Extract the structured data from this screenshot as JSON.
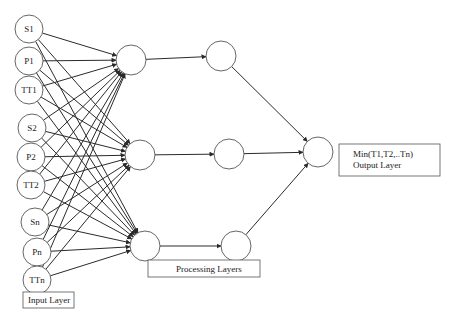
{
  "diagram": {
    "input_nodes": [
      {
        "id": "S1",
        "label": "S1",
        "cx": 29,
        "cy": 29
      },
      {
        "id": "P1",
        "label": "P1",
        "cx": 29,
        "cy": 61
      },
      {
        "id": "TT1",
        "label": "TT1",
        "cx": 29,
        "cy": 90
      },
      {
        "id": "S2",
        "label": "S2",
        "cx": 32,
        "cy": 128
      },
      {
        "id": "P2",
        "label": "P2",
        "cx": 31,
        "cy": 157
      },
      {
        "id": "TT2",
        "label": "TT2",
        "cx": 31,
        "cy": 185
      },
      {
        "id": "Sn",
        "label": "Sn",
        "cx": 35,
        "cy": 222
      },
      {
        "id": "Pn",
        "label": "Pn",
        "cx": 37,
        "cy": 252
      },
      {
        "id": "TTn",
        "label": "TTn",
        "cx": 37,
        "cy": 280
      }
    ],
    "hidden_layer_1": [
      {
        "id": "H1a",
        "cx": 131,
        "cy": 60
      },
      {
        "id": "H1b",
        "cx": 140,
        "cy": 155
      },
      {
        "id": "H1c",
        "cx": 145,
        "cy": 246
      }
    ],
    "hidden_layer_2": [
      {
        "id": "H2a",
        "cx": 221,
        "cy": 56
      },
      {
        "id": "H2b",
        "cx": 229,
        "cy": 154
      },
      {
        "id": "H2c",
        "cx": 236,
        "cy": 246
      }
    ],
    "output_node": {
      "id": "O",
      "cx": 318,
      "cy": 152
    },
    "labels": {
      "input_layer": "Input Layer",
      "processing_layers": "Processing Layers",
      "output_line1": "Min(T1,T2,..Tn)",
      "output_line2": "Output Layer"
    },
    "colors": {
      "stroke": "#2a2a2a",
      "node_stroke": "#555555",
      "background": "#ffffff"
    }
  }
}
